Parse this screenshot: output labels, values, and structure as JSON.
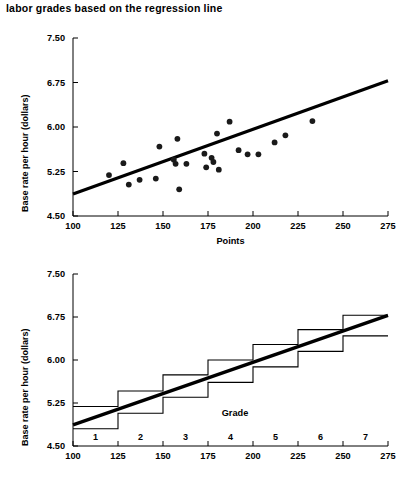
{
  "caption": {
    "text": "labor grades based on the regression line"
  },
  "chart_data": [
    {
      "id": "scatter-regression",
      "type": "scatter",
      "title": "",
      "xlabel": "Points",
      "ylabel": "Base rate per hour (dollars)",
      "xlim": [
        100,
        275
      ],
      "ylim": [
        4.5,
        7.5
      ],
      "xticks": [
        100,
        125,
        150,
        175,
        200,
        225,
        250,
        275
      ],
      "xticklabels": [
        "100",
        "125",
        "150",
        "175",
        "200",
        "225",
        "250",
        "275"
      ],
      "yticks": [
        4.5,
        5.25,
        6.0,
        6.75,
        7.5
      ],
      "yticklabels": [
        "4.50",
        "5.25",
        "6.00",
        "6.75",
        "7.50"
      ],
      "grid": false,
      "legend": "none",
      "points": [
        {
          "x": 120,
          "y": 5.19
        },
        {
          "x": 128,
          "y": 5.39
        },
        {
          "x": 131,
          "y": 5.03
        },
        {
          "x": 137,
          "y": 5.11
        },
        {
          "x": 146,
          "y": 5.13
        },
        {
          "x": 148,
          "y": 5.67
        },
        {
          "x": 156,
          "y": 5.45
        },
        {
          "x": 157,
          "y": 5.38
        },
        {
          "x": 158,
          "y": 5.8
        },
        {
          "x": 159,
          "y": 4.95
        },
        {
          "x": 163,
          "y": 5.38
        },
        {
          "x": 173,
          "y": 5.55
        },
        {
          "x": 174,
          "y": 5.32
        },
        {
          "x": 177,
          "y": 5.48
        },
        {
          "x": 178,
          "y": 5.41
        },
        {
          "x": 180,
          "y": 5.89
        },
        {
          "x": 181,
          "y": 5.28
        },
        {
          "x": 187,
          "y": 6.09
        },
        {
          "x": 192,
          "y": 5.61
        },
        {
          "x": 197,
          "y": 5.54
        },
        {
          "x": 203,
          "y": 5.54
        },
        {
          "x": 212,
          "y": 5.74
        },
        {
          "x": 218,
          "y": 5.86
        },
        {
          "x": 233,
          "y": 6.1
        }
      ],
      "regression_line": {
        "x0": 100,
        "y0": 4.87,
        "x1": 275,
        "y1": 6.78
      }
    },
    {
      "id": "step-labor-grades",
      "type": "line",
      "title": "",
      "xlabel": "Grade",
      "ylabel": "Base rate per hour (dollars)",
      "xlim": [
        100,
        275
      ],
      "ylim": [
        4.5,
        7.5
      ],
      "xticks": [
        100,
        125,
        150,
        175,
        200,
        225,
        250,
        275
      ],
      "xticklabels": [
        "100",
        "125",
        "150",
        "175",
        "200",
        "225",
        "250",
        "275"
      ],
      "yticks": [
        4.5,
        5.25,
        6.0,
        6.75,
        7.5
      ],
      "yticklabels": [
        "4.50",
        "5.25",
        "6.00",
        "6.75",
        "7.50"
      ],
      "grid": false,
      "legend": "none",
      "grade_labels": [
        "1",
        "2",
        "3",
        "4",
        "5",
        "6",
        "7"
      ],
      "grade_label_x": [
        112.5,
        137.5,
        162.5,
        187.5,
        212.5,
        237.5,
        262.5
      ],
      "series": [
        {
          "name": "upper-step",
          "type": "step",
          "edges": [
            100,
            125,
            150,
            175,
            200,
            225,
            250,
            275
          ],
          "values": [
            5.19,
            5.46,
            5.74,
            6.0,
            6.27,
            6.53,
            6.78
          ]
        },
        {
          "name": "lower-step",
          "type": "step",
          "edges": [
            100,
            125,
            150,
            175,
            200,
            225,
            250,
            275
          ],
          "values": [
            4.8,
            5.07,
            5.35,
            5.61,
            5.88,
            6.15,
            6.42
          ]
        }
      ],
      "regression_line": {
        "x0": 100,
        "y0": 4.87,
        "x1": 275,
        "y1": 6.78
      }
    }
  ]
}
